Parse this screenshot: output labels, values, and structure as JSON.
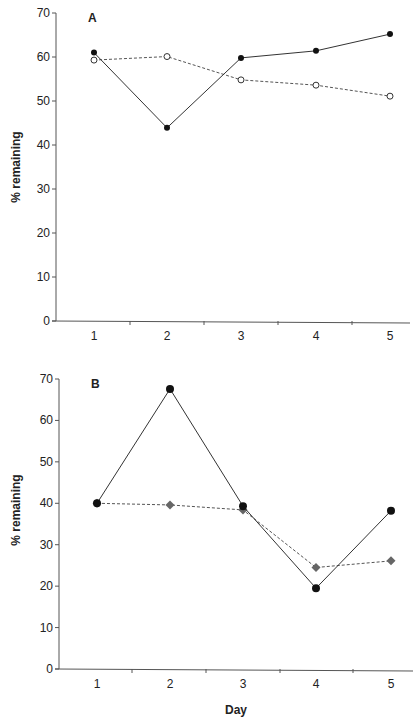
{
  "chart_data": [
    {
      "type": "line",
      "panel_label": "A",
      "title": "",
      "xlabel": "",
      "ylabel": "% remaining",
      "categories": [
        "1",
        "2",
        "3",
        "4",
        "5"
      ],
      "x": [
        1,
        2,
        3,
        4,
        5
      ],
      "ylim": [
        0,
        70
      ],
      "yticks": [
        0,
        10,
        20,
        30,
        40,
        50,
        60,
        70
      ],
      "grid": false,
      "legend": null,
      "series": [
        {
          "name": "filled circles (solid line)",
          "marker": "filled-circle",
          "line": "solid",
          "color": "#111111",
          "values": [
            61.0,
            43.9,
            59.8,
            61.4,
            65.2
          ]
        },
        {
          "name": "open circles (dashed line)",
          "marker": "open-circle",
          "line": "dashed",
          "color": "#444444",
          "values": [
            59.3,
            60.1,
            54.8,
            53.6,
            51.1
          ]
        }
      ]
    },
    {
      "type": "line",
      "panel_label": "B",
      "title": "",
      "xlabel": "Day",
      "ylabel": "% remaining",
      "categories": [
        "1",
        "2",
        "3",
        "4",
        "5"
      ],
      "x": [
        1,
        2,
        3,
        4,
        5
      ],
      "ylim": [
        0,
        70
      ],
      "yticks": [
        0,
        10,
        20,
        30,
        40,
        50,
        60,
        70
      ],
      "grid": false,
      "legend": null,
      "series": [
        {
          "name": "filled circles (solid line)",
          "marker": "filled-circle",
          "line": "solid",
          "color": "#111111",
          "values": [
            40.0,
            67.6,
            39.3,
            19.5,
            38.2
          ]
        },
        {
          "name": "diamonds (dashed line)",
          "marker": "diamond",
          "line": "dashed",
          "color": "#666666",
          "values": [
            40.0,
            39.6,
            38.4,
            24.5,
            26.1
          ]
        }
      ]
    }
  ],
  "layout": {
    "panels": [
      {
        "x_axis_start": 56,
        "x_axis_end": 410,
        "y_zero_px": 321,
        "y_top_px": 13,
        "x_positions": [
          94,
          167,
          241,
          316,
          390
        ],
        "x_ticks": [
          130,
          204,
          278,
          352
        ],
        "marker_r": 3,
        "label_pos": [
          88,
          22
        ],
        "ylabel_pos": [
          20,
          167
        ],
        "xlabel_pos": null
      },
      {
        "x_axis_start": 59,
        "x_axis_end": 413,
        "y_zero_px": 669,
        "y_top_px": 379,
        "x_positions": [
          97,
          170,
          243,
          316,
          391
        ],
        "x_ticks": [
          132,
          206,
          280,
          353
        ],
        "marker_r": 4,
        "label_pos": [
          91,
          388
        ],
        "ylabel_pos": [
          20,
          510
        ],
        "xlabel_pos": [
          236,
          714
        ]
      }
    ]
  }
}
